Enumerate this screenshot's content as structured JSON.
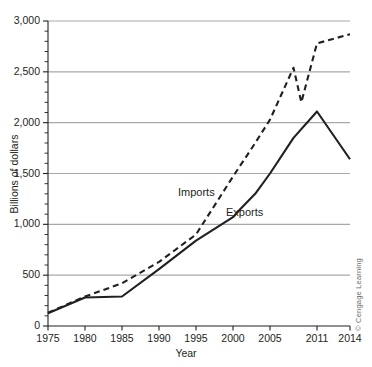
{
  "chart_data": {
    "type": "line",
    "title": "",
    "xlabel": "Year",
    "ylabel": "Billions of dollars",
    "xlim": [
      1975,
      2014
    ],
    "ylim": [
      0,
      3000
    ],
    "grid": true,
    "legend_position": "inline-annotation",
    "y_ticks": [
      0,
      500,
      1000,
      1500,
      2000,
      2500,
      3000
    ],
    "y_tick_labels": [
      "0",
      "500",
      "1,000",
      "1,500",
      "2,000",
      "2,500",
      "3,000"
    ],
    "y_minor_tick_interval": 100,
    "x_ticks": [
      1975,
      1980,
      1985,
      1990,
      1995,
      2000,
      2005,
      2011,
      2014
    ],
    "x_tick_labels": [
      "1975",
      "1980",
      "1985",
      "1990",
      "1995",
      "2000",
      "2005",
      "2011",
      "2014"
    ],
    "series": [
      {
        "name": "Imports",
        "style": "dashed",
        "color": "#231f20",
        "label_annotation": "Imports",
        "x": [
          1975,
          1980,
          1985,
          1990,
          1995,
          2000,
          2003,
          2005,
          2008,
          2009,
          2011,
          2014
        ],
        "values": [
          130,
          290,
          420,
          630,
          900,
          1470,
          1800,
          2030,
          2540,
          2200,
          2780,
          2870
        ]
      },
      {
        "name": "Exports",
        "style": "solid",
        "color": "#231f20",
        "label_annotation": "Exports",
        "x": [
          1975,
          1980,
          1985,
          1990,
          1995,
          2000,
          2001,
          2003,
          2005,
          2008,
          2011,
          2014
        ],
        "values": [
          125,
          280,
          290,
          560,
          840,
          1070,
          1150,
          1300,
          1500,
          1850,
          2110,
          1640
        ]
      }
    ]
  },
  "annotations": {
    "imports": "Imports",
    "exports": "Exports",
    "credit": "© Cengage Learning"
  },
  "axes": {
    "x_title": "Year",
    "y_title": "Billions of dollars"
  },
  "colors": {
    "axis": "#231f20",
    "gridline": "#a7a9ac",
    "text": "#231f20",
    "credit_text": "#6d6e71",
    "background": "#ffffff"
  }
}
